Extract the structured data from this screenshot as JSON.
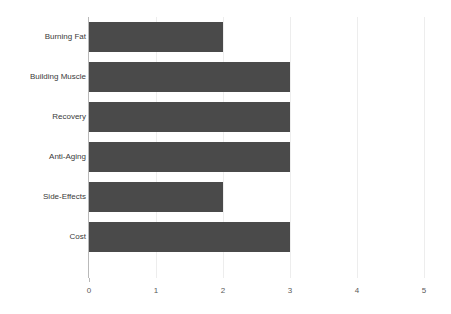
{
  "chart_data": {
    "type": "bar",
    "orientation": "horizontal",
    "title": "",
    "subtitle": "",
    "xlabel": "",
    "ylabel": "",
    "categories": [
      "Burning Fat",
      "Building Muscle",
      "Recovery",
      "Anti-Aging",
      "Side-Effects",
      "Cost"
    ],
    "values": [
      2,
      3,
      3,
      3,
      2,
      3
    ],
    "xlim": [
      0,
      5
    ],
    "xticks": [
      "0",
      "1",
      "2",
      "3",
      "4",
      "5"
    ],
    "xtick_values": [
      0,
      1,
      2,
      3,
      4,
      5
    ],
    "grid": true,
    "grid_axis": "x",
    "legend": false,
    "legend_position": "none",
    "bar_color": "#4a4a4a",
    "gridline_color": "#ededed",
    "axis_color": "#b9b9b9",
    "label_color": "#3a3a3a",
    "tick_label_color": "#5a5a5a",
    "background_color": "#ffffff"
  }
}
